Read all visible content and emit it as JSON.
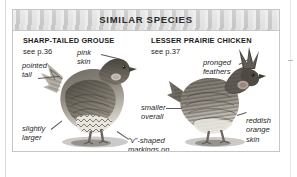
{
  "panel": {
    "header": {
      "title": "SIMILAR SPECIES"
    }
  },
  "species": [
    {
      "name": "SHARP-TAILED GROUSE",
      "page_ref": "see p.36",
      "side": "left",
      "annotations": [
        {
          "id": "pink-skin",
          "text": "pink\nskin"
        },
        {
          "id": "pointed-tail",
          "text": "pointed\ntail"
        },
        {
          "id": "slightly-larger",
          "text": "slightly\nlarger"
        }
      ]
    },
    {
      "name": "LESSER PRAIRIE CHICKEN",
      "page_ref": "see p.37",
      "side": "right",
      "annotations": [
        {
          "id": "pronged-feathers",
          "text": "pronged\nfeathers"
        },
        {
          "id": "smaller-overall",
          "text": "smaller\noverall"
        },
        {
          "id": "v-shaped-markings",
          "text": "\"v\"-shaped\nmarkings on\nunderparts"
        },
        {
          "id": "reddish-orange-skin",
          "text": "reddish\norange\nskin"
        }
      ]
    }
  ],
  "illustrations": [
    {
      "id": "sharp-tailed-grouse-illustration",
      "alt": "grayscale photo of sharp-tailed grouse standing, pointed tail to the left"
    },
    {
      "id": "lesser-prairie-chicken-illustration",
      "alt": "grayscale photo of lesser prairie chicken standing, pronged neck feathers raised"
    }
  ],
  "colors": {
    "band_background": "#d6d6d6",
    "panel_border": "#c6c6c6",
    "text": "#1f1f1f",
    "page_background": "#ffffff"
  }
}
